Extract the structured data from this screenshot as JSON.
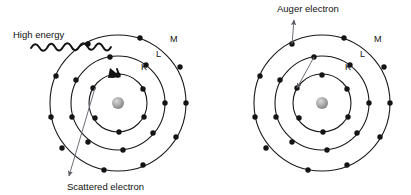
{
  "figure": {
    "background_color": "#ffffff",
    "line_color": "#1a1a1a",
    "electron_color": "#141414",
    "arrow_color": "#6e6e78",
    "nucleus_color": "#9a9a9a",
    "width": 411,
    "height": 195
  },
  "atoms": [
    {
      "id": "left-atom",
      "center": {
        "x": 118,
        "y": 103
      },
      "nucleus_radius": 6,
      "shells": [
        {
          "name": "K",
          "label": "K",
          "radius": 29,
          "label_x": 141,
          "label_y": 70,
          "electron_count": 6
        },
        {
          "name": "L",
          "label": "L",
          "radius": 47,
          "label_x": 156,
          "label_y": 57,
          "electron_count": 8
        },
        {
          "name": "M",
          "label": "M",
          "radius": 68,
          "label_x": 170,
          "label_y": 42,
          "electron_count": 10
        }
      ],
      "annotations": [
        {
          "id": "high-energy",
          "label": "High energy",
          "label_x": 13,
          "label_y": 38,
          "kind": "photon-wave"
        },
        {
          "id": "scattered-electron",
          "label": "Scattered electron",
          "label_x": 67,
          "label_y": 190,
          "kind": "straight-arrow"
        }
      ]
    },
    {
      "id": "right-atom",
      "center": {
        "x": 322,
        "y": 103
      },
      "nucleus_radius": 6,
      "shells": [
        {
          "name": "K",
          "label": "K",
          "radius": 29,
          "label_x": 345,
          "label_y": 70,
          "electron_count": 6
        },
        {
          "name": "L",
          "label": "L",
          "radius": 47,
          "label_x": 360,
          "label_y": 57,
          "electron_count": 8
        },
        {
          "name": "M",
          "label": "M",
          "radius": 68,
          "label_x": 374,
          "label_y": 42,
          "electron_count": 10
        }
      ],
      "annotations": [
        {
          "id": "auger-electron",
          "label": "Auger electron",
          "label_x": 277,
          "label_y": 12,
          "kind": "straight-arrow"
        },
        {
          "id": "l-to-k-transition",
          "label": "",
          "kind": "straight-arrow"
        }
      ]
    }
  ],
  "labels": {
    "high_energy": "High energy",
    "scattered_electron": "Scattered electron",
    "auger_electron": "Auger electron",
    "shell_k": "K",
    "shell_l": "L",
    "shell_m": "M"
  }
}
